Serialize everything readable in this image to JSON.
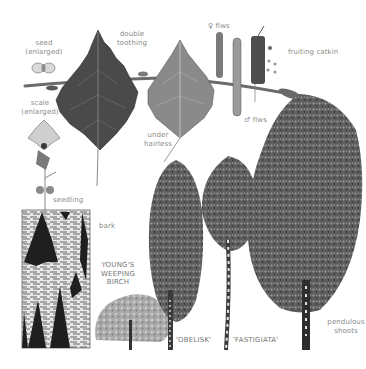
{
  "figure": {
    "background": "#ffffff",
    "ink_color": "#3a3a3a",
    "label_color": "#8a8a8a"
  },
  "labels": {
    "seed": "seed\n(enlarged)",
    "double_toothing": "double\ntoothing",
    "female_flowers": "♀ flws",
    "fruiting_catkin": "fruiting catkin",
    "scale": "scale\n(enlarged)",
    "under_hairless": "under\nhairless",
    "male_flowers": "♂ flws",
    "seedling": "seedling",
    "bark": "bark",
    "youngs_weeping_birch": "YOUNG'S\nWEEPING\nBIRCH",
    "obelisk": "'OBELISK'",
    "fastigiata": "'FASTIGIATA'",
    "pendulous_shoots": "pendulous\nshoots"
  },
  "illustrations": [
    {
      "name": "seed",
      "x": 35,
      "y": 62
    },
    {
      "name": "twig-with-leaves",
      "x": 25,
      "y": 80
    },
    {
      "name": "upper-leaf",
      "x": 95,
      "y": 35
    },
    {
      "name": "under-leaf",
      "x": 180,
      "y": 45
    },
    {
      "name": "catkins",
      "x": 215,
      "y": 30
    },
    {
      "name": "scale",
      "x": 40,
      "y": 130
    },
    {
      "name": "seedling",
      "x": 40,
      "y": 155
    },
    {
      "name": "bark-panel",
      "x": 22,
      "y": 210
    },
    {
      "name": "weeping-birch-tree",
      "x": 130,
      "y": 310
    },
    {
      "name": "obelisk-tree",
      "x": 170,
      "y": 240
    },
    {
      "name": "fastigiata-tree",
      "x": 228,
      "y": 230
    },
    {
      "name": "mature-birch-tree",
      "x": 305,
      "y": 230
    }
  ]
}
